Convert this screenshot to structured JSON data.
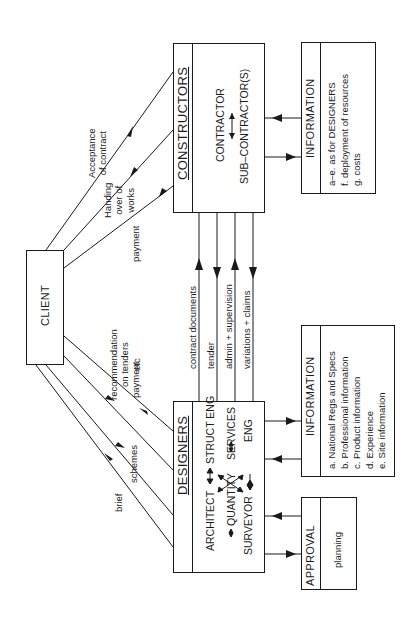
{
  "diagram": {
    "client": {
      "label": "CLIENT"
    },
    "constructors": {
      "title": "CONSTRUCTORS",
      "items": [
        "CONTRACTOR",
        "SUB–CONTRACTOR(S)"
      ]
    },
    "designers": {
      "title": "DESIGNERS",
      "roles": {
        "architect": "ARCHITECT",
        "struct_eng": "STRUCT ENG",
        "quantity": "QUANTITY",
        "surveyor": "SURVEYOR",
        "services": "SERVICES",
        "services_eng": "ENG"
      }
    },
    "info_constructors": {
      "title": "INFORMATION",
      "items": [
        "a–e. as for DESIGNERS",
        "f.  deployment of resources",
        "g.  costs"
      ]
    },
    "info_designers": {
      "title": "INFORMATION",
      "items": [
        "a.  National Regs and Specs",
        "b.  Professional information",
        "c.  Product information",
        "d.  Experience",
        "e.  Site information"
      ]
    },
    "approval": {
      "title": "APPROVAL",
      "item": "planning"
    },
    "client_constructor_flows": {
      "acceptance": [
        "Acceptance",
        "of contract"
      ],
      "handing": [
        "Handing",
        "over of",
        "works"
      ],
      "payment": "payment"
    },
    "client_designer_flows": {
      "recommendation": [
        "recommendation",
        "on tenders",
        "etc"
      ],
      "payment": "payment",
      "schemes": "schemes",
      "brief": "brief"
    },
    "designer_constructor_flows": [
      "contract documents",
      "tender",
      "admin + supervision",
      "variations + claims"
    ],
    "colors": {
      "ink": "#1a1a1a",
      "paper": "#ffffff"
    }
  }
}
